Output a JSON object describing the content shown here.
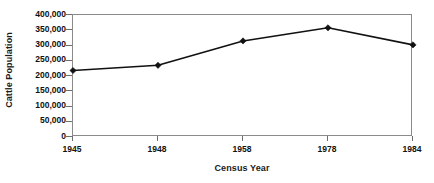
{
  "chart_data": {
    "type": "line",
    "title": "",
    "xlabel": "Census Year",
    "ylabel": "Cattle Population",
    "categories": [
      "1945",
      "1948",
      "1958",
      "1978",
      "1984"
    ],
    "values": [
      218000,
      235000,
      315000,
      358000,
      302000
    ],
    "series": [
      {
        "name": "Cattle Population",
        "values": [
          218000,
          235000,
          315000,
          358000,
          302000
        ]
      }
    ],
    "ylim": [
      0,
      400000
    ],
    "y_ticks": [
      0,
      50000,
      100000,
      150000,
      200000,
      250000,
      300000,
      350000,
      400000
    ],
    "y_tick_labels": [
      "0",
      "50,000",
      "100,000",
      "150,000",
      "200,000",
      "250,000",
      "300,000",
      "350,000",
      "400,000"
    ],
    "x_tick_labels": [
      "1945",
      "1948",
      "1958",
      "1978",
      "1984"
    ],
    "grid": false,
    "legend": false,
    "legend_position": "none",
    "marker": "diamond",
    "line_color": "#111111",
    "marker_color": "#111111",
    "frame_color": "#8a8a8a",
    "background_color": "#ffffff",
    "text_color": "#111111"
  }
}
